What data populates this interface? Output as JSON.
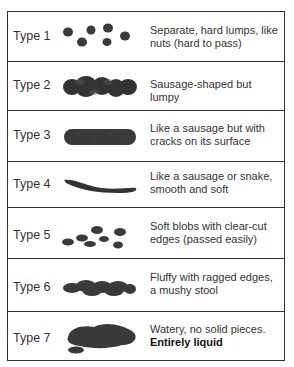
{
  "chart": {
    "rows": [
      {
        "label": "Type 1",
        "description": "Separate, hard lumps, like nuts (hard to pass)",
        "emphasis": ""
      },
      {
        "label": "Type 2",
        "description": "Sausage-shaped but lumpy",
        "emphasis": ""
      },
      {
        "label": "Type 3",
        "description": "Like a sausage but with cracks on its surface",
        "emphasis": ""
      },
      {
        "label": "Type 4",
        "description": "Like a sausage or snake, smooth and soft",
        "emphasis": ""
      },
      {
        "label": "Type 5",
        "description": "Soft blobs with clear-cut edges (passed easily)",
        "emphasis": ""
      },
      {
        "label": "Type 6",
        "description": "Fluffy with ragged edges, a mushy stool",
        "emphasis": ""
      },
      {
        "label": "Type 7",
        "description": "Watery, no solid pieces.",
        "emphasis": "Entirely liquid"
      }
    ]
  },
  "colors": {
    "border": "#333333",
    "shape": "#3a3a3a",
    "text": "#333333"
  }
}
